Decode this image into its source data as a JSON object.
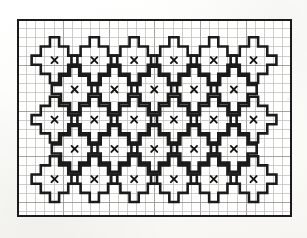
{
  "document": {
    "title": "Cross-Stitch Pattern Chart",
    "kind": "needlework-graph-chart",
    "medium": "printed graph paper"
  },
  "canvas": {
    "width": 307,
    "height": 238,
    "background_color": "#fdfdfb"
  },
  "chart": {
    "name": "repeating-cross-motif-chart",
    "origin_x": 17,
    "origin_y": 19,
    "width": 275,
    "height": 198,
    "cell_size": 9.15,
    "columns": 30,
    "rows": 21,
    "grid_color": "#b9b9b4",
    "major_grid_color": "#8d8d88",
    "major_grid_every": 5,
    "border_color": "#1b1b1b",
    "border_width": 2.2,
    "motif_stroke_color": "#1b1b1b",
    "motif_stroke_width": 2.6,
    "symbol_color": "#141414",
    "symbol_glyph": "X"
  },
  "motif": {
    "name": "greek-cross-plus",
    "description": "Five-by-five plus sign outline with single-cell arms and a centre cell marked X",
    "span_cells": 5,
    "arm_width_cells": 1,
    "center_symbol": "X",
    "outline_path_cells": [
      [
        -0.5,
        -2.5
      ],
      [
        0.5,
        -2.5
      ],
      [
        0.5,
        -1.5
      ],
      [
        1.5,
        -1.5
      ],
      [
        1.5,
        -0.5
      ],
      [
        2.5,
        -0.5
      ],
      [
        2.5,
        0.5
      ],
      [
        1.5,
        0.5
      ],
      [
        1.5,
        1.5
      ],
      [
        0.5,
        1.5
      ],
      [
        0.5,
        2.5
      ],
      [
        -0.5,
        2.5
      ],
      [
        -0.5,
        1.5
      ],
      [
        -1.5,
        1.5
      ],
      [
        -1.5,
        0.5
      ],
      [
        -2.5,
        0.5
      ],
      [
        -2.5,
        -0.5
      ],
      [
        -1.5,
        -0.5
      ],
      [
        -1.5,
        -1.5
      ],
      [
        -0.5,
        -1.5
      ]
    ]
  },
  "layout": {
    "horizontal_spacing_cells": 4.35,
    "vertical_spacing_cells": 2.6,
    "stagger_offset_cells": 2.17,
    "rows_of_motifs": 5,
    "motifs_in_odd_rows": 6,
    "motifs_in_even_rows": 5,
    "total_motifs": 28
  },
  "chart_data": {
    "type": "table",
    "xlabel": "",
    "ylabel": "",
    "grid": true,
    "legend": "none",
    "columns": 30,
    "rows": 21,
    "symbol": "X",
    "motif_rows": [
      {
        "row_index": 0,
        "center_row_cells": 4.5,
        "symbol_count": 6,
        "center_columns_cells": [
          4.1,
          8.45,
          12.8,
          17.15,
          21.5,
          25.85
        ]
      },
      {
        "row_index": 1,
        "center_row_cells": 7.7,
        "symbol_count": 5,
        "center_columns_cells": [
          6.3,
          10.65,
          15.0,
          19.35,
          23.7
        ]
      },
      {
        "row_index": 2,
        "center_row_cells": 11.0,
        "symbol_count": 6,
        "center_columns_cells": [
          4.1,
          8.45,
          12.8,
          17.15,
          21.5,
          25.85
        ]
      },
      {
        "row_index": 3,
        "center_row_cells": 14.2,
        "symbol_count": 5,
        "center_columns_cells": [
          6.3,
          10.65,
          15.0,
          19.35,
          23.7
        ]
      },
      {
        "row_index": 4,
        "center_row_cells": 17.5,
        "symbol_count": 6,
        "center_columns_cells": [
          4.1,
          8.45,
          12.8,
          17.15,
          21.5,
          25.85
        ]
      }
    ]
  },
  "marks": {
    "smudges": [
      {
        "x": 258,
        "y": 62,
        "w": 3,
        "h": 3
      },
      {
        "x": 248,
        "y": 162,
        "w": 3,
        "h": 3
      },
      {
        "x": 287,
        "y": 98,
        "w": 4,
        "h": 2
      }
    ]
  }
}
